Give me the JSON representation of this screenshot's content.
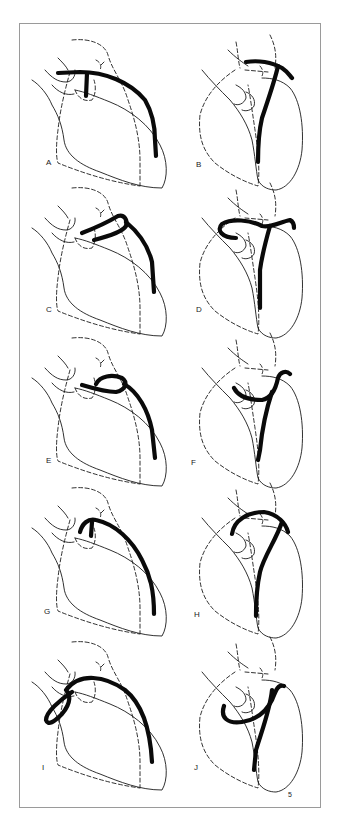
{
  "figure": {
    "figure_number": "5",
    "colors": {
      "line": "#1a1a1a",
      "border": "#9a9a9a",
      "background": "#ffffff"
    },
    "panels": [
      {
        "id": "A",
        "label": "A",
        "view": "left",
        "col": 0,
        "row": 0
      },
      {
        "id": "B",
        "label": "B",
        "view": "right",
        "col": 1,
        "row": 0
      },
      {
        "id": "C",
        "label": "C",
        "view": "left",
        "col": 0,
        "row": 1
      },
      {
        "id": "D",
        "label": "D",
        "view": "right",
        "col": 1,
        "row": 1
      },
      {
        "id": "E",
        "label": "E",
        "view": "left",
        "col": 0,
        "row": 2
      },
      {
        "id": "F",
        "label": "F",
        "view": "right",
        "col": 1,
        "row": 2
      },
      {
        "id": "G",
        "label": "G",
        "view": "left",
        "col": 0,
        "row": 3
      },
      {
        "id": "H",
        "label": "H",
        "view": "right",
        "col": 1,
        "row": 3
      },
      {
        "id": "I",
        "label": "I",
        "view": "left",
        "col": 0,
        "row": 4
      },
      {
        "id": "J",
        "label": "J",
        "view": "right",
        "col": 1,
        "row": 4
      }
    ]
  }
}
